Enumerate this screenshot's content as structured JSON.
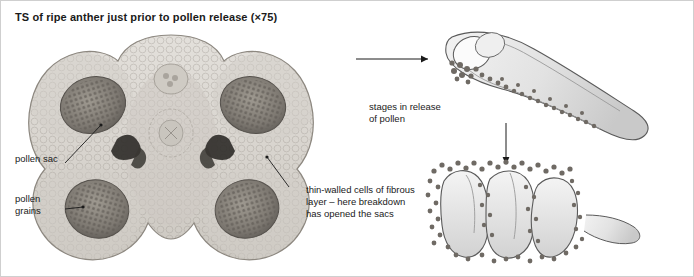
{
  "figure": {
    "title": "TS of ripe anther just prior to pollen release (×75)",
    "labels": {
      "pollen_sac": "pollen sac",
      "pollen_grains": "pollen\ngrains",
      "fibrous_layer": "thin-walled cells of fibrous\nlayer – here breakdown\nhas opened the sacs",
      "stages": "stages in release\nof pollen"
    },
    "colors": {
      "border": "#cfcfcf",
      "text": "#1a1a1a",
      "tissue_light": "#dedbd6",
      "tissue_mid": "#b9b4ad",
      "tissue_dark": "#6f6a64",
      "outline": "#4a4a4a",
      "diagram_fill": "#e6e6e6",
      "grain": "#7a756f"
    },
    "leader_lines": [
      {
        "name": "pollen-sac-leader"
      },
      {
        "name": "pollen-grains-leader"
      },
      {
        "name": "fibrous-layer-leader"
      }
    ],
    "arrows": [
      {
        "name": "arrow-to-stage-one"
      },
      {
        "name": "arrow-to-stage-two"
      }
    ]
  }
}
